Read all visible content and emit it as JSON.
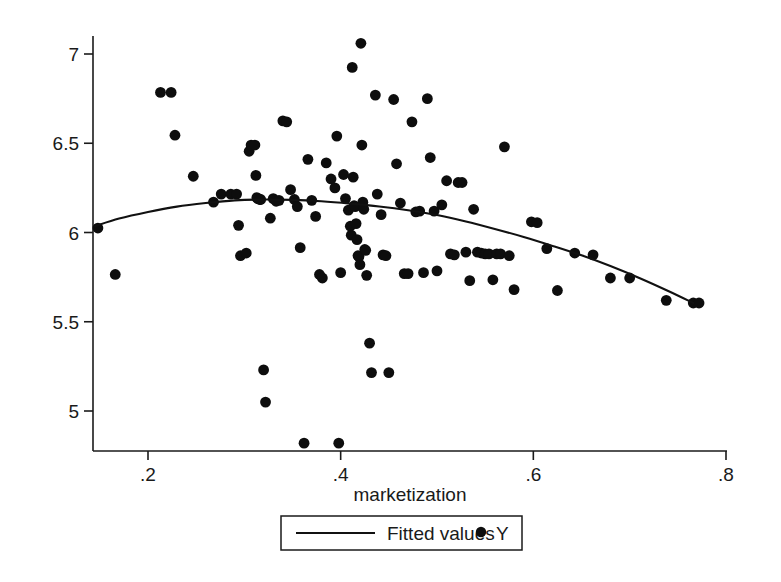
{
  "chart_data": {
    "type": "scatter",
    "title": "",
    "subtitle": "",
    "xlabel": "marketization",
    "ylabel": "",
    "xlim": [
      0.1448,
      0.8
    ],
    "ylim": [
      4.7,
      7.12
    ],
    "grid": false,
    "xticks": [
      0.2,
      0.4,
      0.6,
      0.8
    ],
    "xtick_labels": [
      ".2",
      ".4",
      ".6",
      ".8"
    ],
    "yticks": [
      5,
      5.5,
      6,
      6.5,
      7
    ],
    "ytick_labels": [
      "5",
      "5.5",
      "6",
      "6.5",
      "7"
    ],
    "legend_position": "bottom-center",
    "legend": [
      {
        "name": "Fitted values",
        "marker": "line"
      },
      {
        "name": "Y",
        "marker": "dot"
      }
    ],
    "series": [
      {
        "name": "Y",
        "marker": "dot",
        "color": "#0d0d0d",
        "points": [
          [
            0.148,
            6.025
          ],
          [
            0.166,
            5.765
          ],
          [
            0.213,
            6.785
          ],
          [
            0.224,
            6.785
          ],
          [
            0.228,
            6.545
          ],
          [
            0.247,
            6.315
          ],
          [
            0.268,
            6.17
          ],
          [
            0.276,
            6.215
          ],
          [
            0.286,
            6.215
          ],
          [
            0.292,
            6.215
          ],
          [
            0.294,
            6.04
          ],
          [
            0.296,
            5.87
          ],
          [
            0.302,
            5.885
          ],
          [
            0.305,
            6.455
          ],
          [
            0.307,
            6.49
          ],
          [
            0.311,
            6.49
          ],
          [
            0.312,
            6.32
          ],
          [
            0.313,
            6.195
          ],
          [
            0.314,
            6.19
          ],
          [
            0.316,
            6.185
          ],
          [
            0.317,
            6.185
          ],
          [
            0.32,
            5.23
          ],
          [
            0.322,
            5.05
          ],
          [
            0.327,
            6.08
          ],
          [
            0.33,
            6.19
          ],
          [
            0.333,
            6.175
          ],
          [
            0.336,
            6.18
          ],
          [
            0.34,
            6.625
          ],
          [
            0.344,
            6.62
          ],
          [
            0.348,
            6.24
          ],
          [
            0.352,
            6.185
          ],
          [
            0.355,
            6.145
          ],
          [
            0.358,
            5.915
          ],
          [
            0.362,
            4.82
          ],
          [
            0.366,
            6.41
          ],
          [
            0.37,
            6.18
          ],
          [
            0.374,
            6.09
          ],
          [
            0.378,
            5.765
          ],
          [
            0.381,
            5.745
          ],
          [
            0.385,
            6.39
          ],
          [
            0.39,
            6.3
          ],
          [
            0.394,
            6.25
          ],
          [
            0.396,
            6.54
          ],
          [
            0.398,
            4.82
          ],
          [
            0.4,
            5.775
          ],
          [
            0.403,
            6.325
          ],
          [
            0.405,
            6.19
          ],
          [
            0.408,
            6.125
          ],
          [
            0.41,
            6.035
          ],
          [
            0.411,
            5.985
          ],
          [
            0.412,
            6.925
          ],
          [
            0.413,
            6.31
          ],
          [
            0.414,
            6.15
          ],
          [
            0.415,
            6.145
          ],
          [
            0.416,
            6.05
          ],
          [
            0.417,
            5.96
          ],
          [
            0.418,
            5.87
          ],
          [
            0.419,
            5.865
          ],
          [
            0.42,
            5.82
          ],
          [
            0.421,
            7.06
          ],
          [
            0.422,
            6.49
          ],
          [
            0.423,
            6.17
          ],
          [
            0.424,
            6.13
          ],
          [
            0.425,
            5.905
          ],
          [
            0.426,
            5.9
          ],
          [
            0.427,
            5.76
          ],
          [
            0.43,
            5.38
          ],
          [
            0.432,
            5.215
          ],
          [
            0.436,
            6.77
          ],
          [
            0.438,
            6.215
          ],
          [
            0.442,
            6.1
          ],
          [
            0.444,
            5.875
          ],
          [
            0.447,
            5.87
          ],
          [
            0.45,
            5.215
          ],
          [
            0.455,
            6.745
          ],
          [
            0.458,
            6.385
          ],
          [
            0.462,
            6.165
          ],
          [
            0.466,
            5.77
          ],
          [
            0.47,
            5.77
          ],
          [
            0.474,
            6.62
          ],
          [
            0.478,
            6.115
          ],
          [
            0.482,
            6.12
          ],
          [
            0.486,
            5.775
          ],
          [
            0.49,
            6.75
          ],
          [
            0.493,
            6.42
          ],
          [
            0.497,
            6.12
          ],
          [
            0.5,
            5.785
          ],
          [
            0.505,
            6.155
          ],
          [
            0.51,
            6.29
          ],
          [
            0.514,
            5.88
          ],
          [
            0.518,
            5.875
          ],
          [
            0.522,
            6.28
          ],
          [
            0.526,
            6.28
          ],
          [
            0.53,
            5.89
          ],
          [
            0.534,
            5.73
          ],
          [
            0.538,
            6.13
          ],
          [
            0.542,
            5.89
          ],
          [
            0.546,
            5.885
          ],
          [
            0.55,
            5.88
          ],
          [
            0.554,
            5.88
          ],
          [
            0.558,
            5.735
          ],
          [
            0.562,
            5.88
          ],
          [
            0.566,
            5.88
          ],
          [
            0.57,
            6.48
          ],
          [
            0.575,
            5.87
          ],
          [
            0.58,
            5.68
          ],
          [
            0.598,
            6.06
          ],
          [
            0.604,
            6.055
          ],
          [
            0.614,
            5.91
          ],
          [
            0.625,
            5.675
          ],
          [
            0.643,
            5.885
          ],
          [
            0.662,
            5.875
          ],
          [
            0.68,
            5.745
          ],
          [
            0.7,
            5.745
          ],
          [
            0.738,
            5.62
          ],
          [
            0.766,
            5.605
          ],
          [
            0.772,
            5.605
          ]
        ]
      },
      {
        "name": "Fitted values",
        "marker": "line",
        "color": "#111111",
        "points": [
          [
            0.1448,
            6.035
          ],
          [
            0.17,
            6.078
          ],
          [
            0.2,
            6.115
          ],
          [
            0.23,
            6.145
          ],
          [
            0.26,
            6.165
          ],
          [
            0.29,
            6.18
          ],
          [
            0.32,
            6.185
          ],
          [
            0.35,
            6.183
          ],
          [
            0.38,
            6.175
          ],
          [
            0.41,
            6.162
          ],
          [
            0.44,
            6.146
          ],
          [
            0.47,
            6.125
          ],
          [
            0.5,
            6.098
          ],
          [
            0.53,
            6.062
          ],
          [
            0.56,
            6.02
          ],
          [
            0.59,
            5.975
          ],
          [
            0.62,
            5.925
          ],
          [
            0.65,
            5.872
          ],
          [
            0.68,
            5.812
          ],
          [
            0.71,
            5.745
          ],
          [
            0.74,
            5.672
          ],
          [
            0.766,
            5.605
          ]
        ]
      }
    ]
  }
}
